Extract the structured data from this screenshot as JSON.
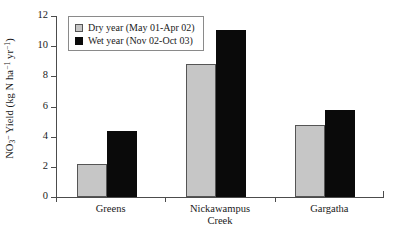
{
  "chart_data": {
    "type": "bar",
    "title": "",
    "xlabel": "",
    "ylabel": "NO3- Yield (kg N ha-1 yr-1)",
    "ylabel_parts": {
      "prefix": "NO",
      "sub": "3",
      "sup_charge": "–",
      "mid": " Yield (kg N ha",
      "sup1": "−1",
      "mid2": " yr",
      "sup2": "−1",
      "suffix": ")"
    },
    "categories": [
      "Greens",
      "Nickawampus Creek",
      "Gargatha"
    ],
    "category_lines": [
      [
        "Greens"
      ],
      [
        "Nickawampus",
        "Creek"
      ],
      [
        "Gargatha"
      ]
    ],
    "series": [
      {
        "name": "Dry year (May 01-Apr 02)",
        "color": "#c6c6c6",
        "values": [
          2.2,
          8.8,
          4.8
        ]
      },
      {
        "name": "Wet year (Nov 02-Oct 03)",
        "color": "#0a0a0a",
        "values": [
          4.4,
          11.1,
          5.8
        ]
      }
    ],
    "ylim": [
      0,
      12
    ],
    "yticks": [
      0,
      2,
      4,
      6,
      8,
      10,
      12
    ],
    "ytick_labels": [
      "0",
      "2",
      "4",
      "6",
      "8",
      "10",
      "12"
    ],
    "grid": false,
    "legend_position": "top-left"
  },
  "legend": {
    "items": [
      {
        "label": "Dry year (May 01-Apr 02)",
        "swatch": "dry"
      },
      {
        "label": "Wet year (Nov 02-Oct 03)",
        "swatch": "wet"
      }
    ]
  }
}
